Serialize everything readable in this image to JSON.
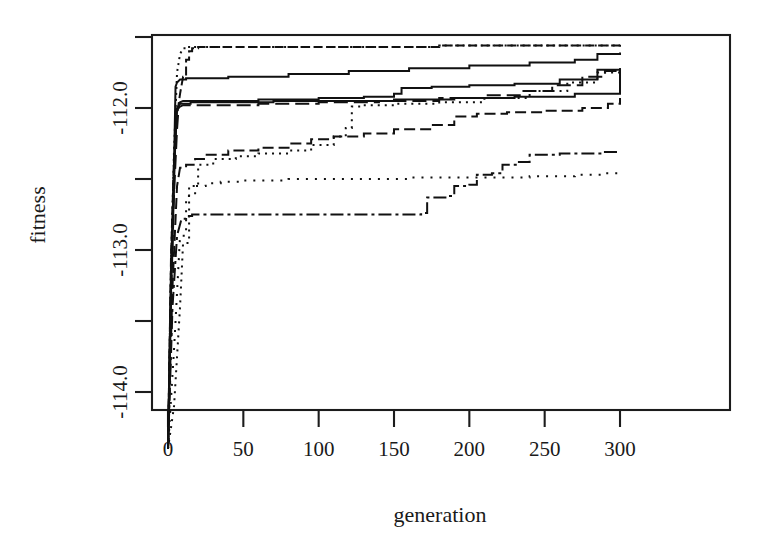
{
  "figure": {
    "background_color": "#ffffff",
    "ink_color": "#111111",
    "plot_box": {
      "left": 152,
      "top": 35,
      "right": 730,
      "bottom": 410
    }
  },
  "axes": {
    "x": {
      "label": "generation",
      "tick_values": [
        0,
        50,
        100,
        150,
        200,
        250,
        300
      ],
      "tick_labels": [
        "0",
        "50",
        "100",
        "150",
        "200",
        "250",
        "300"
      ],
      "range": [
        -4,
        306
      ],
      "pixel_at_min": 168,
      "pixel_at_max": 620,
      "px_per_unit": 1.5067
    },
    "y": {
      "label": "fitness",
      "tick_values": [
        -111.5,
        -112.0,
        -112.5,
        -113.0,
        -113.5,
        -114.0
      ],
      "tick_labels": [
        "",
        "-112.0",
        "",
        "-113.0",
        "",
        "-114.0"
      ],
      "labeled_ticks": [
        "-112.0",
        "-113.0",
        "-114.0"
      ],
      "range": [
        -114.4,
        -111.3
      ],
      "pixel_at_m112": 108,
      "pixel_at_m114": 392,
      "px_per_unit": 142
    }
  },
  "chart_data": {
    "type": "line",
    "title": "",
    "xlabel": "generation",
    "ylabel": "fitness",
    "xlim": [
      -4,
      306
    ],
    "ylim": [
      -114.4,
      -111.3
    ],
    "grid": false,
    "legend": "none",
    "n_series": 10,
    "note": "Ten monotone non-decreasing best-so-far fitness traces of an evolutionary run; all series rise almost vertically within the first ~8 generations from about -114.4 and then creep upward in small steps toward roughly -111.55 to -111.95.",
    "series": [
      {
        "name": "run-1",
        "style": "dashed-heavy",
        "dasharray": "9,4",
        "x": [
          0,
          2,
          4,
          6,
          8,
          10,
          12,
          14,
          16,
          20,
          30,
          60,
          100,
          140,
          180,
          220,
          260,
          300
        ],
        "y": [
          -114.4,
          -113.05,
          -112.35,
          -112.05,
          -111.9,
          -111.78,
          -111.66,
          -111.6,
          -111.58,
          -111.57,
          -111.57,
          -111.57,
          -111.57,
          -111.57,
          -111.56,
          -111.56,
          -111.56,
          -111.55
        ]
      },
      {
        "name": "run-2",
        "style": "solid",
        "dasharray": "none",
        "x": [
          0,
          2,
          4,
          5,
          6,
          8,
          12,
          40,
          80,
          120,
          160,
          200,
          240,
          270,
          285,
          300
        ],
        "y": [
          -114.4,
          -113.2,
          -112.4,
          -111.85,
          -111.82,
          -111.8,
          -111.79,
          -111.78,
          -111.76,
          -111.74,
          -111.72,
          -111.7,
          -111.68,
          -111.66,
          -111.62,
          -111.61
        ]
      },
      {
        "name": "run-3",
        "style": "solid",
        "dasharray": "none",
        "x": [
          0,
          2,
          4,
          5,
          6,
          7,
          8,
          10,
          20,
          60,
          100,
          130,
          150,
          155,
          175,
          200,
          230,
          260,
          285,
          300
        ],
        "y": [
          -114.4,
          -113.3,
          -112.55,
          -112.1,
          -112.02,
          -111.99,
          -111.96,
          -111.95,
          -111.95,
          -111.94,
          -111.93,
          -111.92,
          -111.9,
          -111.86,
          -111.85,
          -111.84,
          -111.83,
          -111.8,
          -111.73,
          -111.72
        ]
      },
      {
        "name": "run-4",
        "style": "dashed-long",
        "dasharray": "14,6",
        "x": [
          0,
          2,
          4,
          6,
          7,
          8,
          10,
          25,
          60,
          100,
          140,
          180,
          210,
          235,
          255,
          275,
          290,
          300
        ],
        "y": [
          -114.4,
          -113.35,
          -112.6,
          -112.15,
          -112.0,
          -111.99,
          -111.98,
          -111.98,
          -111.97,
          -111.96,
          -111.95,
          -111.93,
          -111.91,
          -111.88,
          -111.84,
          -111.78,
          -111.74,
          -111.73
        ]
      },
      {
        "name": "run-5",
        "style": "dotted-fine",
        "dasharray": "2,5",
        "x": [
          0,
          4,
          8,
          10,
          14,
          20,
          30,
          45,
          60,
          80,
          95,
          110,
          118,
          122,
          128,
          150,
          180,
          210,
          240,
          265,
          285,
          300
        ],
        "y": [
          -114.4,
          -114.1,
          -113.4,
          -112.95,
          -112.55,
          -112.4,
          -112.36,
          -112.34,
          -112.32,
          -112.3,
          -112.26,
          -112.2,
          -112.14,
          -111.99,
          -111.98,
          -111.97,
          -111.96,
          -111.93,
          -111.88,
          -111.82,
          -111.75,
          -111.73
        ]
      },
      {
        "name": "run-6",
        "style": "dashed-medium",
        "dasharray": "11,5",
        "x": [
          0,
          3,
          6,
          8,
          12,
          18,
          25,
          40,
          60,
          80,
          95,
          110,
          130,
          150,
          175,
          190,
          205,
          225,
          250,
          275,
          292,
          300
        ],
        "y": [
          -114.4,
          -113.25,
          -112.55,
          -112.42,
          -112.4,
          -112.36,
          -112.33,
          -112.3,
          -112.28,
          -112.25,
          -112.22,
          -112.2,
          -112.18,
          -112.15,
          -112.12,
          -112.06,
          -112.04,
          -112.03,
          -112.02,
          -112.0,
          -111.97,
          -111.93
        ]
      },
      {
        "name": "run-7",
        "style": "dotted-sparse",
        "dasharray": "2,7",
        "x": [
          0,
          4,
          8,
          12,
          18,
          25,
          35,
          50,
          80,
          120,
          160,
          200,
          240,
          270,
          290,
          300
        ],
        "y": [
          -114.4,
          -113.7,
          -112.9,
          -112.62,
          -112.55,
          -112.53,
          -112.52,
          -112.51,
          -112.5,
          -112.5,
          -112.49,
          -112.49,
          -112.48,
          -112.47,
          -112.46,
          -112.46
        ]
      },
      {
        "name": "run-8",
        "style": "dash-dot",
        "dasharray": "13,4,3,4",
        "x": [
          0,
          3,
          6,
          9,
          12,
          16,
          40,
          90,
          140,
          168,
          172,
          185,
          190,
          200,
          205,
          215,
          222,
          232,
          240,
          260,
          290,
          300
        ],
        "y": [
          -114.4,
          -113.4,
          -112.9,
          -112.78,
          -112.76,
          -112.75,
          -112.75,
          -112.75,
          -112.75,
          -112.74,
          -112.63,
          -112.62,
          -112.55,
          -112.54,
          -112.47,
          -112.46,
          -112.4,
          -112.38,
          -112.33,
          -112.32,
          -112.31,
          -112.31
        ]
      },
      {
        "name": "run-9",
        "style": "dotted-dense",
        "dasharray": "2,4",
        "x": [
          0,
          2,
          4,
          6,
          8,
          10,
          14,
          18,
          30,
          60,
          120,
          180,
          240,
          280,
          300
        ],
        "y": [
          -114.4,
          -113.1,
          -112.3,
          -111.75,
          -111.62,
          -111.58,
          -111.57,
          -111.57,
          -111.57,
          -111.57,
          -111.57,
          -111.56,
          -111.56,
          -111.56,
          -111.55
        ]
      },
      {
        "name": "run-10",
        "style": "solid-thin",
        "dasharray": "none",
        "x": [
          0,
          2,
          4,
          6,
          8,
          15,
          30,
          70,
          110,
          150,
          190,
          230,
          270,
          300
        ],
        "y": [
          -114.4,
          -113.15,
          -112.45,
          -112.0,
          -111.97,
          -111.96,
          -111.96,
          -111.95,
          -111.95,
          -111.94,
          -111.93,
          -111.92,
          -111.9,
          -111.72
        ]
      }
    ]
  }
}
